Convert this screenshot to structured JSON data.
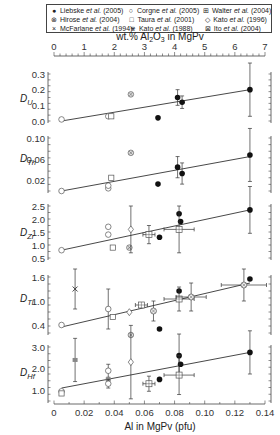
{
  "legend": [
    {
      "symbol": "●",
      "author": "Liebske",
      "year": "(2005)"
    },
    {
      "symbol": "○",
      "author": "Corgne",
      "year": "(2005)"
    },
    {
      "symbol": "⊞",
      "author": "Walter",
      "year": "(2004)"
    },
    {
      "symbol": "⊗",
      "author": "Hirose",
      "year": "(2004)"
    },
    {
      "symbol": "□",
      "author": "Taura",
      "year": "(2001)"
    },
    {
      "symbol": "◇",
      "author": "Kato",
      "year": "(1996)"
    },
    {
      "symbol": "×",
      "author": "McFarlane",
      "year": "(1994)"
    },
    {
      "symbol": "⋇",
      "author": "Kato",
      "year": "(1988)"
    },
    {
      "symbol": "⊠",
      "author": "Ito",
      "year": "(2004)"
    }
  ],
  "etal": "et al.",
  "chart_data": {
    "type": "scatter",
    "top_axis": {
      "label": "wt.% Al2O3 in MgPv",
      "ticks": [
        "0",
        "1",
        "2",
        "3",
        "4",
        "5",
        "6",
        "7"
      ],
      "range": [
        0,
        7
      ]
    },
    "bottom_axis": {
      "label": "Al in MgPv (pfu)",
      "ticks": [
        "0",
        "0.02",
        "0.04",
        "0.06",
        "0.08",
        "0.10",
        "0.12",
        "0.14"
      ],
      "range": [
        0,
        0.14
      ]
    },
    "panels": [
      {
        "name": "D_U",
        "label": "D",
        "sub": "U",
        "ylim": [
          0,
          0.3
        ],
        "ticks": [
          "0.3",
          "0.2",
          "0.1",
          "0.0"
        ],
        "fit": [
          [
            0.005,
            0.0
          ],
          [
            0.13,
            0.2
          ]
        ],
        "points": [
          {
            "series": "Corgne 2005",
            "x": 0.005,
            "y": 0.01
          },
          {
            "series": "Corgne 2005",
            "x": 0.036,
            "y": 0.03
          },
          {
            "series": "Taura 2001",
            "x": 0.038,
            "y": 0.03
          },
          {
            "series": "Hirose 2004",
            "x": 0.051,
            "y": 0.17
          },
          {
            "series": "Liebske 2005",
            "x": 0.069,
            "y": 0.02
          },
          {
            "series": "Liebske 2005",
            "x": 0.082,
            "y": 0.15,
            "yerr": 0.05
          },
          {
            "series": "Liebske 2005",
            "x": 0.085,
            "y": 0.12,
            "yerr": 0.04
          },
          {
            "series": "Liebske 2005",
            "x": 0.13,
            "y": 0.2,
            "yerr": 0.17
          }
        ]
      },
      {
        "name": "D_Th",
        "label": "D",
        "sub": "Th",
        "ylim": [
          0,
          0.1
        ],
        "ticks": [
          "0.10",
          "0.06",
          "0.02"
        ],
        "fit": [
          [
            0.005,
            0.0
          ],
          [
            0.13,
            0.065
          ]
        ],
        "points": [
          {
            "series": "Corgne 2005",
            "x": 0.005,
            "y": 0.0
          },
          {
            "series": "Corgne 2005",
            "x": 0.036,
            "y": 0.005
          },
          {
            "series": "Corgne 2005",
            "x": 0.036,
            "y": 0.01
          },
          {
            "series": "Taura 2001",
            "x": 0.038,
            "y": 0.025
          },
          {
            "series": "Hirose 2004",
            "x": 0.051,
            "y": 0.072
          },
          {
            "series": "Liebske 2005",
            "x": 0.069,
            "y": 0.013
          },
          {
            "series": "Liebske 2005",
            "x": 0.082,
            "y": 0.045,
            "yerr": 0.02
          },
          {
            "series": "Liebske 2005",
            "x": 0.085,
            "y": 0.033,
            "yerr": 0.02
          },
          {
            "series": "Liebske 2005",
            "x": 0.13,
            "y": 0.068,
            "yerr": 0.05
          }
        ]
      },
      {
        "name": "D_Zr",
        "label": "D",
        "sub": "Zr",
        "ylim": [
          0.5,
          2.5
        ],
        "ticks": [
          "2.5",
          "2.0",
          "1.5",
          "1.0",
          "0.5"
        ],
        "fit": [
          [
            0.005,
            0.8
          ],
          [
            0.13,
            2.35
          ]
        ],
        "points": [
          {
            "series": "Corgne 2005",
            "x": 0.005,
            "y": 0.8
          },
          {
            "series": "Corgne 2005",
            "x": 0.036,
            "y": 1.4
          },
          {
            "series": "Corgne 2005",
            "x": 0.036,
            "y": 1.7
          },
          {
            "series": "Taura 2001",
            "x": 0.039,
            "y": 0.9
          },
          {
            "series": "Hirose 2004",
            "x": 0.05,
            "y": 0.9
          },
          {
            "series": "Kato 1996",
            "x": 0.051,
            "y": 1.6,
            "yerr": 0.9
          },
          {
            "series": "Walter 2004",
            "x": 0.063,
            "y": 1.4,
            "yerr": 0.35,
            "xerr": 0.004
          },
          {
            "series": "Liebske 2005",
            "x": 0.07,
            "y": 1.3
          },
          {
            "series": "Liebske 2005",
            "x": 0.083,
            "y": 2.2
          },
          {
            "series": "Liebske 2005",
            "x": 0.084,
            "y": 1.9
          },
          {
            "series": "Walter 2004",
            "x": 0.083,
            "y": 1.6,
            "yerr": 0.9,
            "xerr": 0.01
          },
          {
            "series": "Liebske 2005",
            "x": 0.13,
            "y": 2.35,
            "yerr": 0.9
          }
        ]
      },
      {
        "name": "D_Ti",
        "label": "D",
        "sub": "Ti",
        "ylim": [
          0.2,
          1.6
        ],
        "ticks": [
          "1.6",
          "1.0",
          "0.4"
        ],
        "fit": [
          [
            0.005,
            0.35
          ],
          [
            0.13,
            1.45
          ]
        ],
        "points": [
          {
            "series": "Corgne 2005",
            "x": 0.005,
            "y": 0.4
          },
          {
            "series": "McFarlane 1994",
            "x": 0.014,
            "y": 1.3,
            "yerr": 0.5
          },
          {
            "series": "Corgne 2005",
            "x": 0.036,
            "y": 0.8,
            "yerr": 0.5
          },
          {
            "series": "Taura 2001",
            "x": 0.039,
            "y": 0.6
          },
          {
            "series": "Hirose 2004",
            "x": 0.051,
            "y": 0.15
          },
          {
            "series": "Kato 1996",
            "x": 0.05,
            "y": 0.72
          },
          {
            "series": "Walter 2004",
            "x": 0.058,
            "y": 0.9,
            "xerr": 0.004
          },
          {
            "series": "Ito 2004",
            "x": 0.066,
            "y": 0.75,
            "yerr": 0.25
          },
          {
            "series": "Liebske 2005",
            "x": 0.07,
            "y": 0.3
          },
          {
            "series": "Liebske 2005",
            "x": 0.083,
            "y": 1.25
          },
          {
            "series": "Walter 2004",
            "x": 0.083,
            "y": 1.05,
            "yerr": 0.3,
            "xerr": 0.01
          },
          {
            "series": "Ito 2004",
            "x": 0.091,
            "y": 1.1,
            "yerr": 0.35,
            "xerr": 0.01
          },
          {
            "series": "Ito 2004",
            "x": 0.126,
            "y": 1.4,
            "yerr": 0.4,
            "xerr": 0.015
          },
          {
            "series": "Liebske 2005",
            "x": 0.13,
            "y": 1.55
          }
        ]
      },
      {
        "name": "D_Hf",
        "label": "D",
        "sub": "Hf",
        "ylim": [
          0.5,
          3.5
        ],
        "ticks": [
          "3.0",
          "2.0",
          "1.0"
        ],
        "fit": [
          [
            0.005,
            1.1
          ],
          [
            0.13,
            2.75
          ]
        ],
        "points": [
          {
            "series": "Corgne 2005",
            "x": 0.005,
            "y": 0.95
          },
          {
            "series": "Taura 2001",
            "x": 0.005,
            "y": 0.85
          },
          {
            "series": "Kato 1988",
            "x": 0.014,
            "y": 2.4,
            "yerr": 1.0
          },
          {
            "series": "Corgne 2005",
            "x": 0.036,
            "y": 1.9,
            "yerr": 0.3
          },
          {
            "series": "Kato 1988",
            "x": 0.036,
            "y": 1.5
          },
          {
            "series": "Corgne 2005",
            "x": 0.036,
            "y": 1.3,
            "yerr": 0.2
          },
          {
            "series": "Kato 1996",
            "x": 0.051,
            "y": 2.3,
            "yerr": 1.7
          },
          {
            "series": "Walter 2004",
            "x": 0.063,
            "y": 1.3,
            "yerr": 0.35,
            "xerr": 0.004
          },
          {
            "series": "Liebske 2005",
            "x": 0.07,
            "y": 1.5
          },
          {
            "series": "Liebske 2005",
            "x": 0.083,
            "y": 2.6,
            "yerr": 1.0
          },
          {
            "series": "Liebske 2005",
            "x": 0.084,
            "y": 2.2
          },
          {
            "series": "Walter 2004",
            "x": 0.083,
            "y": 1.7,
            "yerr": 0.9,
            "xerr": 0.01
          },
          {
            "series": "Liebske 2005",
            "x": 0.13,
            "y": 2.75,
            "yerr": 1.0
          }
        ]
      }
    ]
  }
}
